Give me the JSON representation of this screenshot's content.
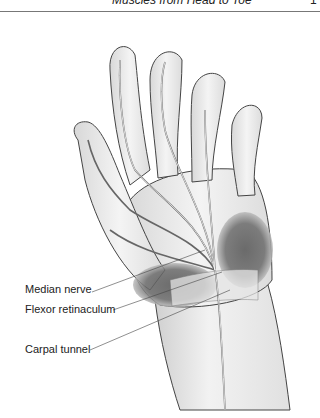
{
  "header": {
    "running_title": "Muscles from Head to Toe",
    "page_number": "1"
  },
  "figure": {
    "labels": [
      {
        "text": "Median nerve"
      },
      {
        "text": "Flexor retinaculum"
      },
      {
        "text": "Carpal tunnel"
      }
    ]
  }
}
